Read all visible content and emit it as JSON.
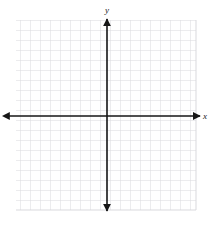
{
  "figure": {
    "name": "blank-cartesian-coordinate-grid",
    "type": "coordinate-plane",
    "width": 215,
    "height": 227,
    "background_color": "#ffffff"
  },
  "grid": {
    "line_color": "#d9d9dd",
    "cell_size_px": 10,
    "columns": 18,
    "rows": 19,
    "left_px": 16,
    "top_px": 20,
    "right_px": 196,
    "bottom_px": 210,
    "visible": true
  },
  "axes": {
    "color": "#161616",
    "line_width_px": 1.6,
    "arrowheads": "both-ends",
    "x_axis": {
      "label": "x",
      "label_x_px": 205,
      "label_y_px": 119,
      "position_y_px": 116,
      "start_x_px": 8,
      "end_x_px": 200,
      "tick_labels": [],
      "ticks_visible": false
    },
    "y_axis": {
      "label": "y",
      "label_x_px": 107,
      "label_y_px": 12,
      "position_x_px": 107,
      "start_y_px": 18,
      "end_y_px": 212,
      "tick_labels": [],
      "ticks_visible": false
    },
    "origin": {
      "x_px": 107,
      "y_px": 116,
      "label": ""
    }
  },
  "plot": {
    "series": [],
    "points": [],
    "annotations": [],
    "title": "",
    "legend": null
  }
}
